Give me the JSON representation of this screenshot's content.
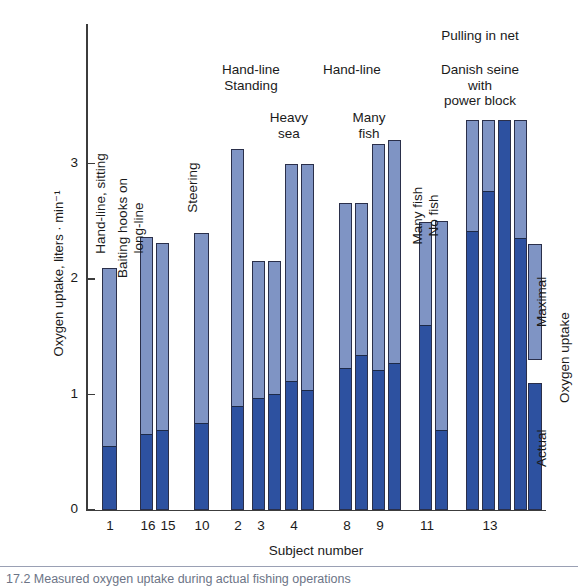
{
  "chart_data": {
    "type": "bar",
    "title": "",
    "xlabel": "Subject number",
    "ylabel": "Oxygen uptake, liters · min⁻¹",
    "ylim": [
      0,
      3.6
    ],
    "yticks": [
      "0",
      "1",
      "2",
      "3"
    ],
    "ytick_values": [
      0,
      1,
      2,
      3
    ],
    "grid": false,
    "legend_position": "right",
    "series": [
      {
        "name": "Maximal",
        "color": "#7f94c4"
      },
      {
        "name": "Actual",
        "color": "#2d51a0"
      }
    ],
    "legend_group_label": "Oxygen uptake",
    "categories": [
      "1",
      "16",
      "15",
      "10",
      "2",
      "3",
      "4",
      "8",
      "9",
      "11",
      "13"
    ],
    "bars": [
      {
        "id": "b1",
        "subject": "1",
        "maximal": 2.09,
        "actual": 0.55,
        "x": 102,
        "w": 15
      },
      {
        "id": "b2",
        "subject": "16",
        "maximal": 2.36,
        "actual": 0.66,
        "x": 140,
        "w": 13
      },
      {
        "id": "b3",
        "subject": "15",
        "maximal": 2.31,
        "actual": 0.69,
        "x": 156,
        "w": 13
      },
      {
        "id": "b4",
        "subject": "10",
        "maximal": 2.4,
        "actual": 0.75,
        "x": 194,
        "w": 15
      },
      {
        "id": "b5",
        "subject": "2",
        "maximal": 3.12,
        "actual": 0.9,
        "x": 231,
        "w": 13
      },
      {
        "id": "b6",
        "subject": "3a",
        "maximal": 2.15,
        "actual": 0.97,
        "x": 252,
        "w": 13
      },
      {
        "id": "b7",
        "subject": "3b",
        "maximal": 2.15,
        "actual": 1.0,
        "x": 268,
        "w": 13
      },
      {
        "id": "b8",
        "subject": "4a",
        "maximal": 2.99,
        "actual": 1.12,
        "x": 285,
        "w": 13
      },
      {
        "id": "b9",
        "subject": "4b",
        "maximal": 2.99,
        "actual": 1.04,
        "x": 301,
        "w": 13
      },
      {
        "id": "b10",
        "subject": "8a",
        "maximal": 2.66,
        "actual": 1.23,
        "x": 339,
        "w": 13
      },
      {
        "id": "b11",
        "subject": "8b",
        "maximal": 2.66,
        "actual": 1.34,
        "x": 355,
        "w": 13
      },
      {
        "id": "b12",
        "subject": "9a",
        "maximal": 3.17,
        "actual": 1.21,
        "x": 372,
        "w": 13
      },
      {
        "id": "b13",
        "subject": "9b",
        "maximal": 3.2,
        "actual": 1.27,
        "x": 388,
        "w": 13
      },
      {
        "id": "b14",
        "subject": "11a",
        "maximal": 2.49,
        "actual": 1.6,
        "x": 419,
        "w": 13
      },
      {
        "id": "b15",
        "subject": "11b",
        "maximal": 2.5,
        "actual": 0.69,
        "x": 435,
        "w": 13
      },
      {
        "id": "b16",
        "subject": "13a",
        "maximal": 3.37,
        "actual": 2.41,
        "x": 466,
        "w": 13
      },
      {
        "id": "b17",
        "subject": "13b",
        "maximal": 3.37,
        "actual": 2.76,
        "x": 482,
        "w": 13
      },
      {
        "id": "b18",
        "subject": "13c",
        "maximal": 3.37,
        "actual": 3.37,
        "x": 498,
        "w": 13
      },
      {
        "id": "b19",
        "subject": "13d",
        "maximal": 3.37,
        "actual": 2.35,
        "x": 514,
        "w": 13
      }
    ],
    "annotations": [
      {
        "id": "a1",
        "text": "Hand-line, sitting",
        "orient": "vertical"
      },
      {
        "id": "a2",
        "text": "Baiting hooks on\nlong-line",
        "orient": "vertical"
      },
      {
        "id": "a3",
        "text": "Steering",
        "orient": "vertical"
      },
      {
        "id": "a4",
        "text": "Hand-line\nStanding",
        "orient": "horizontal"
      },
      {
        "id": "a5",
        "text": "Heavy\nsea",
        "orient": "horizontal"
      },
      {
        "id": "a6",
        "text": "Hand-line",
        "orient": "horizontal"
      },
      {
        "id": "a7",
        "text": "Many\nfish",
        "orient": "horizontal"
      },
      {
        "id": "a8",
        "text": "Many fish",
        "orient": "vertical"
      },
      {
        "id": "a9",
        "text": "No fish",
        "orient": "vertical"
      },
      {
        "id": "a10",
        "text": "Pulling in net",
        "orient": "horizontal"
      },
      {
        "id": "a11",
        "text": "Danish seine\nwith\npower block",
        "orient": "horizontal"
      }
    ],
    "xtick_labels": [
      {
        "label": "1",
        "x": 90
      },
      {
        "label": "16",
        "x": 128
      },
      {
        "label": "15",
        "x": 148
      },
      {
        "label": "10",
        "x": 182
      },
      {
        "label": "2",
        "x": 218
      },
      {
        "label": "3",
        "x": 241
      },
      {
        "label": "4",
        "x": 274
      },
      {
        "label": "8",
        "x": 327
      },
      {
        "label": "9",
        "x": 360
      },
      {
        "label": "11",
        "x": 407
      },
      {
        "label": "13",
        "x": 470
      }
    ]
  },
  "caption": {
    "text": "17.2   Measured oxygen uptake during actual fishing operations"
  }
}
